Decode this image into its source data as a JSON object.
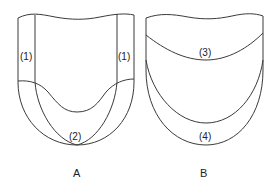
{
  "figure": {
    "panels": [
      {
        "id": "A",
        "caption": "A",
        "regions": [
          {
            "label": "(1)",
            "position": "left-side band"
          },
          {
            "label": "(1)",
            "position": "right-side band"
          },
          {
            "label": "(2)",
            "position": "bottom U-shaped band"
          }
        ]
      },
      {
        "id": "B",
        "caption": "B",
        "regions": [
          {
            "label": "(3)",
            "position": "upper crescent band"
          },
          {
            "label": "(4)",
            "position": "lower crescent band"
          }
        ]
      }
    ],
    "colors": {
      "line": "#3a3a3a",
      "text": "#222222",
      "background": "#ffffff"
    }
  }
}
